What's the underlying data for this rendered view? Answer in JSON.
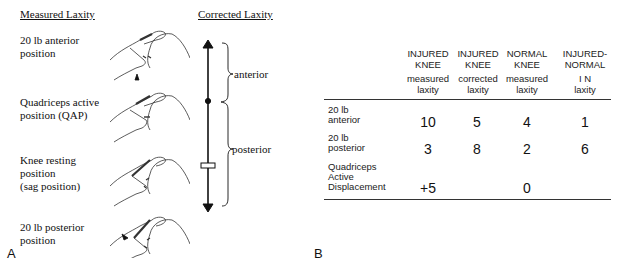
{
  "panel_a": {
    "label": "A",
    "measured_header": "Measured Laxity",
    "corrected_header": "Corrected Laxity",
    "positions": [
      {
        "line1": "20 lb anterior",
        "line2": "position",
        "line3": ""
      },
      {
        "line1": "Quadriceps active",
        "line2": "position (QAP)",
        "line3": ""
      },
      {
        "line1": "Knee resting",
        "line2": "position",
        "line3": "(sag position)"
      },
      {
        "line1": "20 lb posterior",
        "line2": "position",
        "line3": ""
      }
    ],
    "scale": {
      "anterior_label": "anterior",
      "posterior_label": "posterior"
    }
  },
  "panel_b": {
    "label": "B",
    "columns": [
      {
        "title1": "INJURED",
        "title2": "KNEE",
        "sub1": "measured",
        "sub2": "laxity"
      },
      {
        "title1": "INJURED",
        "title2": "KNEE",
        "sub1": "corrected",
        "sub2": "laxity"
      },
      {
        "title1": "NORMAL",
        "title2": "KNEE",
        "sub1": "measured",
        "sub2": "laxity"
      },
      {
        "title1": "INJURED-",
        "title2": "NORMAL",
        "sub1": "I N",
        "sub2": "laxity"
      }
    ],
    "rows": [
      {
        "label1": "20 lb",
        "label2": "anterior",
        "label3": "",
        "values": [
          "10",
          "5",
          "4",
          "1"
        ]
      },
      {
        "label1": "20 lb",
        "label2": "posterior",
        "label3": "",
        "values": [
          "3",
          "8",
          "2",
          "6"
        ]
      },
      {
        "label1": "Quadriceps",
        "label2": "Active",
        "label3": "Displacement",
        "values": [
          "+5",
          "",
          "0",
          ""
        ]
      }
    ]
  }
}
